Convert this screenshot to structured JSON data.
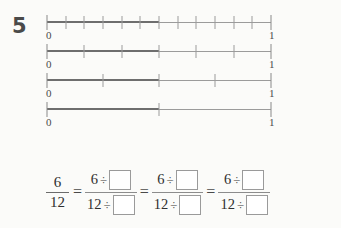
{
  "worksheet": {
    "problem_number": "5",
    "background_color": "#fbfbf9",
    "ink_color": "#3a3a3a"
  },
  "number_lines": {
    "count": 4,
    "start_label": "0",
    "end_label": "1",
    "lines": [
      {
        "id": "line-twelfths",
        "denominator": 12,
        "divisions": 12,
        "shaded_numerator": 6,
        "shaded_fraction": "6/12",
        "start_label": "0",
        "end_label": "1"
      },
      {
        "id": "line-sixths",
        "denominator": 6,
        "divisions": 6,
        "shaded_numerator": 3,
        "shaded_fraction": "3/6",
        "start_label": "0",
        "end_label": "1"
      },
      {
        "id": "line-fourths",
        "denominator": 4,
        "divisions": 4,
        "shaded_numerator": 2,
        "shaded_fraction": "2/4",
        "start_label": "0",
        "end_label": "1"
      },
      {
        "id": "line-halves",
        "denominator": 2,
        "divisions": 2,
        "shaded_numerator": 1,
        "shaded_fraction": "1/2",
        "start_label": "0",
        "end_label": "1"
      }
    ]
  },
  "equation": {
    "start_fraction": {
      "numerator": "6",
      "denominator": "12"
    },
    "equals_sign": "=",
    "division_symbol": "÷",
    "terms": [
      {
        "numerator_value": "6",
        "numerator_operator": "÷",
        "numerator_box_value": "",
        "denominator_value": "12",
        "denominator_operator": "÷",
        "denominator_box_value": ""
      },
      {
        "numerator_value": "6",
        "numerator_operator": "÷",
        "numerator_box_value": "",
        "denominator_value": "12",
        "denominator_operator": "÷",
        "denominator_box_value": ""
      },
      {
        "numerator_value": "6",
        "numerator_operator": "÷",
        "numerator_box_value": "",
        "denominator_value": "12",
        "denominator_operator": "÷",
        "denominator_box_value": ""
      }
    ]
  }
}
